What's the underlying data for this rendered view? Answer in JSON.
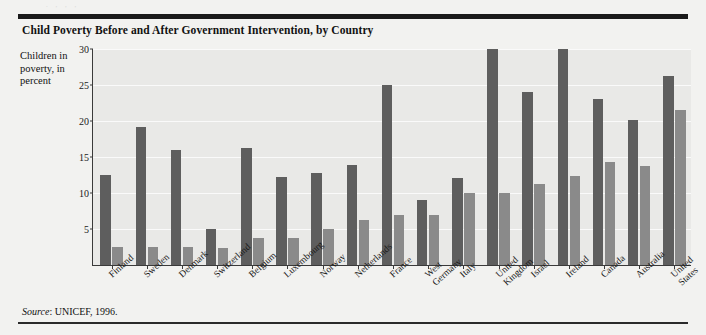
{
  "figure": {
    "title": "Child Poverty Before and After Government Intervention, by Country",
    "axis_caption": "Children in poverty, in percent",
    "source_word": "Source",
    "source_rest": ": UNICEF, 1996.",
    "top_smudge": ". ,  , ,",
    "colors": {
      "before_bar": "#5e5e5e",
      "after_bar": "#8a8a8a",
      "plot_background": "#e9e9e7",
      "figure_background": "#f2f2f0",
      "rule": "#1a1a1a",
      "gridline": "#fafafa"
    }
  },
  "chart_data": {
    "type": "bar",
    "title": "Child Poverty Before and After Government Intervention, by Country",
    "xlabel": "",
    "ylabel": "Children in poverty, in percent",
    "ylim": [
      0,
      30
    ],
    "yticks": [
      5,
      10,
      15,
      20,
      25,
      30
    ],
    "grid": true,
    "legend_position": "top-center",
    "categories": [
      "Finland",
      "Sweden",
      "Denmark",
      "Switzerland",
      "Belgium",
      "Luxembourg",
      "Norway",
      "Netherlands",
      "France",
      "West Germany",
      "Italy",
      "United Kingdom",
      "Israel",
      "Ireland",
      "Canada",
      "Australia",
      "United States"
    ],
    "series": [
      {
        "name": "Before taxes and transfers",
        "color": "#5e5e5e",
        "values": [
          12.5,
          19.1,
          16.0,
          5.0,
          16.2,
          12.2,
          12.8,
          13.9,
          25.0,
          9.0,
          12.1,
          30.0,
          24.0,
          30.0,
          23.0,
          20.2,
          26.2
        ]
      },
      {
        "name": "After taxes and transfers",
        "color": "#8a8a8a",
        "values": [
          2.5,
          2.5,
          2.5,
          2.4,
          3.8,
          3.8,
          5.0,
          6.2,
          7.0,
          7.0,
          10.0,
          10.0,
          11.3,
          12.3,
          14.3,
          13.7,
          21.5
        ]
      }
    ],
    "source": "Source: UNICEF, 1996."
  }
}
